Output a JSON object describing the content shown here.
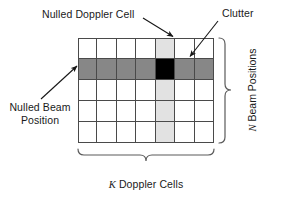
{
  "figure": {
    "kind": "radar-space-time-grid-diagram",
    "grid": {
      "columns": 7,
      "rows": 5,
      "doppler_column_index": 4,
      "beam_row_index": 1,
      "colors": {
        "cell_fill": "#ffffff",
        "cell_border": "#4a4a4a",
        "nulled_doppler_cell": "#e2e2e2",
        "nulled_beam_position": "#878787",
        "clutter": "#000000"
      }
    },
    "labels": {
      "nulled_doppler_cell": "Nulled Doppler Cell",
      "clutter": "Clutter",
      "nulled_beam_position_line1": "Nulled Beam",
      "nulled_beam_position_line2": "Position",
      "beam_positions_symbol": "N",
      "beam_positions_text": " Beam Positions",
      "doppler_cells_symbol": "K",
      "doppler_cells_text": " Doppler Cells"
    }
  }
}
